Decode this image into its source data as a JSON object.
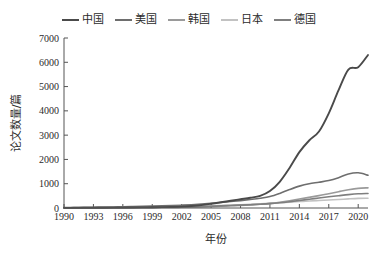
{
  "chart_data": {
    "type": "line",
    "title": "",
    "xlabel": "年份",
    "ylabel": "论文数量/篇",
    "grid": false,
    "legend_position": "top",
    "xlim": [
      1990,
      2021
    ],
    "ylim": [
      0,
      7000
    ],
    "ytick_values": [
      0,
      1000,
      2000,
      3000,
      4000,
      5000,
      6000,
      7000
    ],
    "ytick_labels": [
      "0",
      "1000",
      "2000",
      "3000",
      "4000",
      "5000",
      "6000",
      "7000"
    ],
    "xtick_values": [
      1990,
      1993,
      1996,
      1999,
      2002,
      2005,
      2008,
      2011,
      2014,
      2017,
      2020
    ],
    "xtick_labels": [
      "1990",
      "1993",
      "1996",
      "1999",
      "2002",
      "2005",
      "2008",
      "2011",
      "2014",
      "2017",
      "2020"
    ],
    "x": [
      1990,
      1991,
      1992,
      1993,
      1994,
      1995,
      1996,
      1997,
      1998,
      1999,
      2000,
      2001,
      2002,
      2003,
      2004,
      2005,
      2006,
      2007,
      2008,
      2009,
      2010,
      2011,
      2012,
      2013,
      2014,
      2015,
      2016,
      2017,
      2018,
      2019,
      2020,
      2021
    ],
    "series": [
      {
        "name": "中国",
        "color": "#4a4a4a",
        "values": [
          5,
          6,
          8,
          10,
          12,
          14,
          17,
          20,
          24,
          28,
          34,
          42,
          55,
          80,
          120,
          175,
          235,
          300,
          360,
          420,
          500,
          700,
          1080,
          1650,
          2300,
          2780,
          3150,
          3900,
          4850,
          5700,
          5800,
          6300
        ]
      },
      {
        "name": "美国",
        "color": "#6e6e6e",
        "values": [
          20,
          24,
          28,
          33,
          38,
          44,
          50,
          58,
          66,
          76,
          88,
          100,
          115,
          135,
          160,
          190,
          225,
          265,
          305,
          350,
          400,
          470,
          600,
          760,
          900,
          1000,
          1060,
          1130,
          1250,
          1400,
          1450,
          1350
        ]
      },
      {
        "name": "韩国",
        "color": "#9a9a9a",
        "values": [
          2,
          2,
          3,
          4,
          5,
          6,
          8,
          10,
          12,
          15,
          18,
          22,
          28,
          35,
          45,
          58,
          72,
          90,
          110,
          130,
          155,
          190,
          240,
          300,
          370,
          440,
          510,
          590,
          670,
          750,
          810,
          830
        ]
      },
      {
        "name": "日本",
        "color": "#c2c2c2",
        "values": [
          8,
          9,
          11,
          13,
          15,
          18,
          21,
          25,
          29,
          34,
          40,
          46,
          54,
          64,
          76,
          90,
          105,
          120,
          135,
          150,
          168,
          190,
          215,
          240,
          265,
          290,
          310,
          330,
          350,
          375,
          395,
          400
        ]
      },
      {
        "name": "德国",
        "color": "#7f7f7f",
        "values": [
          6,
          7,
          8,
          10,
          12,
          14,
          16,
          19,
          22,
          26,
          30,
          35,
          42,
          50,
          60,
          72,
          86,
          102,
          118,
          136,
          156,
          180,
          215,
          260,
          310,
          360,
          410,
          460,
          505,
          550,
          585,
          600
        ]
      }
    ]
  }
}
